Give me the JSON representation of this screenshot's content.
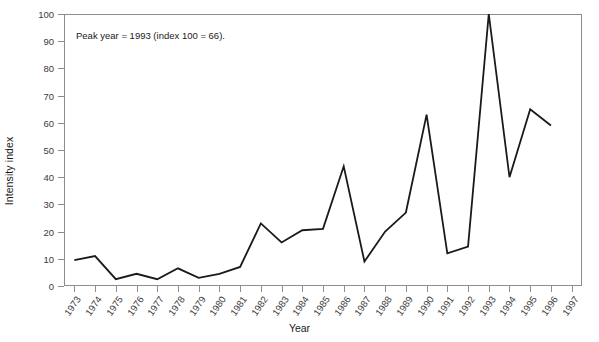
{
  "chart_data": {
    "type": "line",
    "title": "",
    "xlabel": "Year",
    "ylabel": "Intensity index",
    "xlim": [
      1973,
      1997
    ],
    "ylim": [
      0,
      100
    ],
    "grid": false,
    "legend": null,
    "annotation": "Peak year = 1993 (index 100 = 66).",
    "y_ticks": [
      0,
      10,
      20,
      30,
      40,
      50,
      60,
      70,
      80,
      90,
      100
    ],
    "categories": [
      "1973",
      "1974",
      "1975",
      "1976",
      "1977",
      "1978",
      "1979",
      "1980",
      "1981",
      "1982",
      "1983",
      "1984",
      "1985",
      "1986",
      "1987",
      "1988",
      "1989",
      "1990",
      "1991",
      "1992",
      "1993",
      "1994",
      "1995",
      "1996",
      "1997"
    ],
    "series": [
      {
        "name": "Intensity index",
        "color": "#1a1a1a",
        "x": [
          "1973",
          "1974",
          "1975",
          "1976",
          "1977",
          "1978",
          "1979",
          "1980",
          "1981",
          "1982",
          "1983",
          "1984",
          "1985",
          "1986",
          "1987",
          "1988",
          "1989",
          "1990",
          "1991",
          "1992",
          "1993",
          "1994",
          "1995",
          "1996"
        ],
        "values": [
          9.5,
          11,
          2.5,
          4.5,
          2.5,
          6.5,
          3,
          4.5,
          7,
          23,
          16,
          20.5,
          21,
          44,
          9,
          20,
          27,
          63,
          12,
          14.5,
          100,
          40,
          65,
          59
        ]
      }
    ]
  },
  "axes": {
    "y_title": "Intensity index",
    "x_title": "Year"
  }
}
